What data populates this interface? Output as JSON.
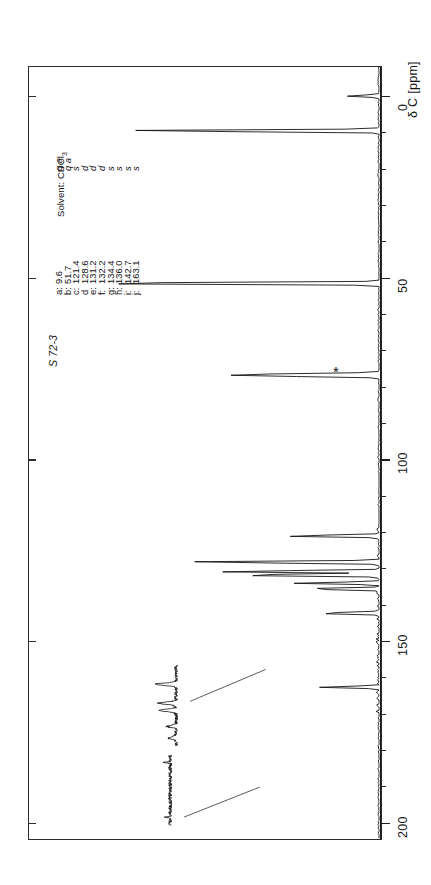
{
  "page": {
    "caption_faint": "",
    "background": "#ffffff",
    "ink": "#141414"
  },
  "sample": {
    "id": "S 72-3"
  },
  "solvent": {
    "label": "Solvent:",
    "name": "CDCl",
    "name_sub": "3",
    "full": "Solvent: CDCl3",
    "marker_symbol": "*",
    "marker_shift_ppm": 77.0
  },
  "axis": {
    "title": "δ C [ppm]",
    "nucleus": "13C",
    "unit": "ppm",
    "ticks": [
      0,
      50,
      100,
      150,
      200
    ],
    "tick_labels": [
      "0",
      "50",
      "100",
      "150",
      "200"
    ],
    "range_min_ppm": -8,
    "range_max_ppm": 205,
    "direction": "increasing-downward"
  },
  "assignments": {
    "header": "Solvent: CDCl3",
    "rows": [
      {
        "label": "a:",
        "shift": "9.6",
        "mult": "q"
      },
      {
        "label": "b:",
        "shift": "51.7",
        "mult": "q"
      },
      {
        "label": "c:",
        "shift": "121.4",
        "mult": "s"
      },
      {
        "label": "d",
        "shift": "128.6",
        "mult": "d"
      },
      {
        "label": "e:",
        "shift": "131.2",
        "mult": "d"
      },
      {
        "label": "f:",
        "shift": "132.2",
        "mult": "d"
      },
      {
        "label": "g:",
        "shift": "134.4",
        "mult": "s"
      },
      {
        "label": "h:",
        "shift": "136.0",
        "mult": "s"
      },
      {
        "label": "i:",
        "shift": "142.7",
        "mult": "s"
      },
      {
        "label": "j:",
        "shift": "163.1",
        "mult": "s"
      }
    ]
  },
  "multiplicity_row": [
    "q a",
    "q a",
    "s",
    "d",
    "d",
    "d",
    "s",
    "s",
    "s",
    "s"
  ],
  "chart_data": {
    "type": "line",
    "xlabel": "δ C [ppm]",
    "ylabel": "intensity",
    "xlim": [
      -8,
      205
    ],
    "grid": false,
    "legend": false,
    "axis_ticks": [
      0,
      50,
      100,
      150,
      200
    ],
    "peaks": [
      {
        "shift": 0.0,
        "intensity": 0.1,
        "assignment": "",
        "multiplicity": "",
        "note": "TMS / reference region"
      },
      {
        "shift": 9.6,
        "intensity": 0.82,
        "assignment": "a",
        "multiplicity": "q",
        "note": "CH3"
      },
      {
        "shift": 51.7,
        "intensity": 1.0,
        "assignment": "b",
        "multiplicity": "q",
        "note": "OCH3"
      },
      {
        "shift": 76.7,
        "intensity": 0.22,
        "assignment": "*",
        "multiplicity": "t",
        "note": "CDCl3 solvent"
      },
      {
        "shift": 77.0,
        "intensity": 0.28,
        "assignment": "*",
        "multiplicity": "t",
        "note": "CDCl3 solvent"
      },
      {
        "shift": 77.3,
        "intensity": 0.22,
        "assignment": "*",
        "multiplicity": "t",
        "note": "CDCl3 solvent"
      },
      {
        "shift": 121.4,
        "intensity": 0.3,
        "assignment": "c",
        "multiplicity": "s",
        "note": ""
      },
      {
        "shift": 128.6,
        "intensity": 0.62,
        "assignment": "d",
        "multiplicity": "d",
        "note": ""
      },
      {
        "shift": 131.2,
        "intensity": 0.52,
        "assignment": "e",
        "multiplicity": "d",
        "note": ""
      },
      {
        "shift": 132.2,
        "intensity": 0.48,
        "assignment": "f",
        "multiplicity": "d",
        "note": ""
      },
      {
        "shift": 134.4,
        "intensity": 0.26,
        "assignment": "g",
        "multiplicity": "s",
        "note": ""
      },
      {
        "shift": 136.0,
        "intensity": 0.24,
        "assignment": "h",
        "multiplicity": "s",
        "note": ""
      },
      {
        "shift": 142.7,
        "intensity": 0.2,
        "assignment": "i",
        "multiplicity": "s",
        "note": ""
      },
      {
        "shift": 163.1,
        "intensity": 0.18,
        "assignment": "j",
        "multiplicity": "s",
        "note": ""
      }
    ],
    "expansions": [
      {
        "label": "aromatic-expansion-upper",
        "from_ppm": 126.0,
        "to_ppm": 137.0
      },
      {
        "label": "aromatic-expansion-lower",
        "from_ppm": 140.0,
        "to_ppm": 166.0
      }
    ]
  }
}
